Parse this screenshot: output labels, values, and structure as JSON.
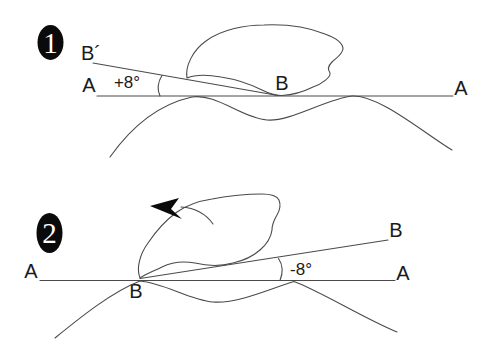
{
  "figure": {
    "colors": {
      "background": "#ffffff",
      "line": "#4a4a4a",
      "text": "#1a1a1a",
      "badge_fill": "#0a0a0a",
      "badge_text": "#ffffff"
    },
    "icons": {
      "rotation_arrow": "curved-arrow-counterclockwise"
    },
    "panels": [
      {
        "badge": "1",
        "left_axis_label": "A",
        "right_axis_label": "A",
        "rotated_line_label": "B´",
        "contact_point_label": "B",
        "angle_label": "+8°"
      },
      {
        "badge": "2",
        "left_axis_label": "A",
        "right_axis_label": "A",
        "rotated_line_label": "B",
        "contact_point_label": "B",
        "angle_label": "-8°"
      }
    ]
  }
}
